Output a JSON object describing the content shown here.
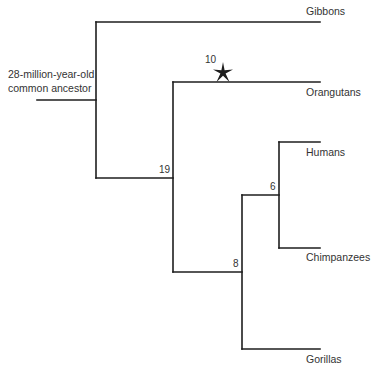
{
  "diagram": {
    "type": "phylogenetic-tree",
    "root": {
      "label_line1": "28-million-year-old",
      "label_line2": "common ancestor"
    },
    "taxa": [
      {
        "name": "Gibbons"
      },
      {
        "name": "Orangutans"
      },
      {
        "name": "Humans"
      },
      {
        "name": "Chimpanzees"
      },
      {
        "name": "Gorillas"
      }
    ],
    "nodes": [
      {
        "id": "hominidae",
        "label": "19"
      },
      {
        "id": "homininae",
        "label": "8"
      },
      {
        "id": "hominini",
        "label": "6"
      }
    ],
    "marker": {
      "icon": "star-icon",
      "label": "10",
      "on_branch": "Orangutans"
    },
    "colors": {
      "line": "#1e1e1e",
      "text": "#333333",
      "background": "#ffffff"
    }
  }
}
